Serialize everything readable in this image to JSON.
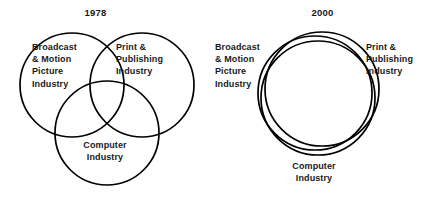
{
  "figure": {
    "background_color": "#ffffff",
    "stroke_color": "#000000",
    "text_color": "#1a1a1a"
  },
  "panels": [
    {
      "id": "1978",
      "title": "1978",
      "layout": "three-circle-venn-partial-overlap",
      "circles": [
        {
          "name": "broadcast-motion-picture-circle",
          "cx": 72,
          "cy": 85,
          "r": 52
        },
        {
          "name": "print-publishing-circle",
          "cx": 142,
          "cy": 85,
          "r": 52
        },
        {
          "name": "computer-circle",
          "cx": 107,
          "cy": 133,
          "r": 52
        }
      ],
      "labels": {
        "broadcast": "Broadcast\n& Motion\nPicture\nIndustry",
        "print": "Print &\nPublishing\nIndustry",
        "computer": "Computer\nIndustry"
      }
    },
    {
      "id": "2000",
      "title": "2000",
      "layout": "three-circle-near-coincident-convergence",
      "circles": [
        {
          "name": "broadcast-motion-picture-circle",
          "cx": 100,
          "cy": 93,
          "r": 57
        },
        {
          "name": "print-publishing-circle",
          "cx": 107,
          "cy": 89,
          "r": 57
        },
        {
          "name": "computer-circle",
          "cx": 103,
          "cy": 98,
          "r": 57
        }
      ],
      "labels": {
        "broadcast": "Broadcast\n& Motion\nPicture\nIndustry",
        "print": "Print &\nPublishing\nIndustry",
        "computer": "Computer\nIndustry"
      }
    }
  ]
}
